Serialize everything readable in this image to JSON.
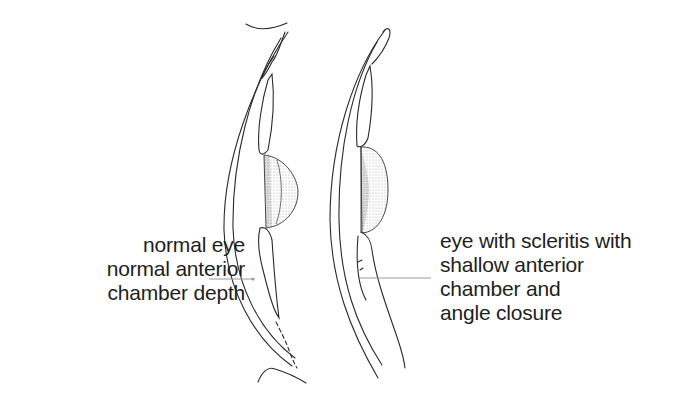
{
  "figure": {
    "panels": [
      {
        "id": "normal",
        "caption_lines": [
          "normal eye",
          "normal anterior",
          "chamber depth"
        ],
        "leader_line_color": "#9a9a9a"
      },
      {
        "id": "scleritis",
        "caption_lines": [
          "eye with scleritis with",
          "shallow anterior",
          "chamber and",
          "angle closure"
        ],
        "leader_line_color": "#9a9a9a"
      }
    ],
    "colors": {
      "ink": "#2a2a2a",
      "stipple": "#555555",
      "background": "#ffffff"
    }
  }
}
